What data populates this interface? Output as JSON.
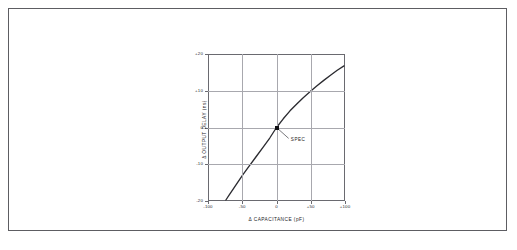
{
  "figure": {
    "frame_color": "#5d5d62",
    "background": "#ffffff"
  },
  "chart_data": {
    "type": "line",
    "title": "",
    "subtitle": "",
    "xlabel": "Δ CAPACITANCE (pF)",
    "ylabel": "Δ OUTPUT DELAY (ns)",
    "xlim": [
      -100,
      100
    ],
    "ylim": [
      -20,
      20
    ],
    "grid": true,
    "legend": null,
    "xticks": [
      -100,
      -50,
      0,
      50,
      100
    ],
    "xticklabels": [
      "-100",
      "-50",
      "0",
      "+50",
      "+100"
    ],
    "yticks": [
      -20,
      -10,
      0,
      10,
      20
    ],
    "yticklabels": [
      "-20",
      "-10",
      "0",
      "+10",
      "+20"
    ],
    "series": [
      {
        "name": "output delay vs capacitance",
        "color": "#2b2b30",
        "x": [
          -75,
          -70,
          -60,
          -50,
          -40,
          -30,
          -20,
          -10,
          0,
          10,
          20,
          30,
          40,
          50,
          60,
          70,
          80,
          90,
          100
        ],
        "y": [
          -20.0,
          -18.6,
          -15.8,
          -13.1,
          -10.5,
          -8.0,
          -5.5,
          -2.9,
          0.0,
          2.4,
          4.6,
          6.5,
          8.3,
          9.9,
          11.5,
          13.0,
          14.4,
          15.8,
          17.0
        ]
      }
    ],
    "annotations": [
      {
        "name": "spec-point",
        "label": "SPEC",
        "x": 0,
        "y": 0,
        "marker": "square",
        "marker_color": "#111114",
        "leader_to_x": 18,
        "leader_to_y": -3.0
      }
    ]
  }
}
